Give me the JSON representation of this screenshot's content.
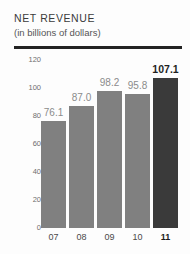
{
  "chart_data": {
    "type": "bar",
    "title": "NET REVENUE",
    "subtitle": "(in billions of dollars)",
    "xlabel": "",
    "ylabel": "",
    "ylim": [
      0,
      120
    ],
    "yticks": [
      0,
      20,
      40,
      60,
      80,
      100,
      120
    ],
    "ytick_labels": [
      "0",
      "20",
      "40",
      "60",
      "80",
      "100",
      "120"
    ],
    "grid": false,
    "legend": "none",
    "categories": [
      "07",
      "08",
      "09",
      "10",
      "11"
    ],
    "values": [
      76.1,
      87.0,
      98.2,
      95.8,
      107.1
    ],
    "value_labels": [
      "76.1",
      "87.0",
      "98.2",
      "95.8",
      "107.1"
    ],
    "highlight_index": 4,
    "colors": {
      "bar": "#808080",
      "bar_highlight": "#3a3a3a",
      "label": "#8b8b8b",
      "label_highlight": "#1f1f1f",
      "rule": "#232323",
      "axis_text": "#6e6e6e",
      "background": "#fdfdfd"
    }
  }
}
